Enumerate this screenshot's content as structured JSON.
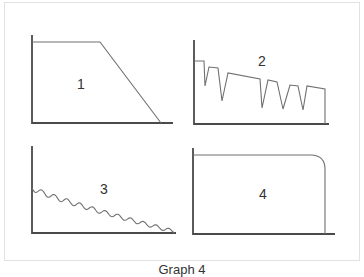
{
  "figure": {
    "caption": "Graph 4",
    "panels": [
      {
        "id": "1",
        "label": "1",
        "shape": "plateau-then-linear-decline"
      },
      {
        "id": "2",
        "label": "2",
        "shape": "gradual-decline-with-sharp-dips"
      },
      {
        "id": "3",
        "label": "3",
        "shape": "wavy-gradual-decline"
      },
      {
        "id": "4",
        "label": "4",
        "shape": "flat-then-sudden-drop"
      }
    ]
  },
  "colors": {
    "axis": "#4a4a4a",
    "curve": "#707070",
    "frame": "#e2e2e2"
  }
}
